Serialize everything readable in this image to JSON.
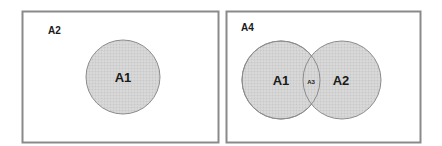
{
  "diagrams": [
    {
      "name": "single-set",
      "universe_label": "A2",
      "circles": [
        {
          "label": "A1"
        }
      ]
    },
    {
      "name": "two-set-overlap",
      "universe_label": "A4",
      "circles": [
        {
          "label": "A1"
        },
        {
          "label": "A2"
        }
      ],
      "intersection_label": "A3"
    }
  ],
  "colors": {
    "frame": "#8a8a8a",
    "circle_fill": "#d4d4d4",
    "circle_stroke": "#8c8c8c",
    "text": "#1a1a1a"
  }
}
